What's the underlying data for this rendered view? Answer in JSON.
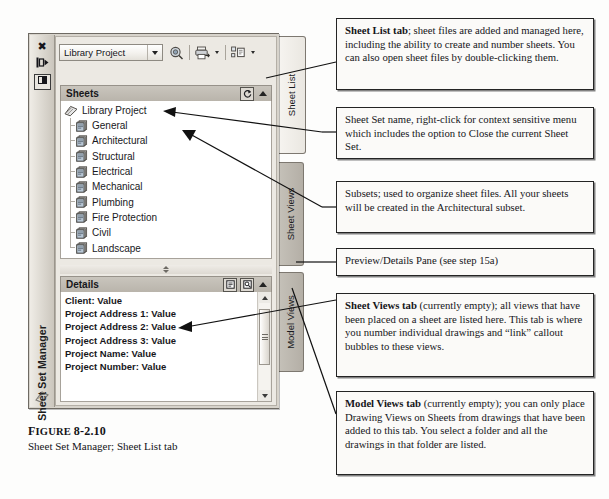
{
  "figure": {
    "label_prefix": "F",
    "label_rest": "IGURE",
    "number": "8-2.10",
    "caption": "Sheet Set Manager; Sheet List tab"
  },
  "palette": {
    "title": "Sheet Set Manager",
    "title_buttons": [
      {
        "name": "close",
        "glyph": "✖"
      },
      {
        "name": "auto-hide",
        "glyph": "❙▶"
      },
      {
        "name": "properties-menu",
        "glyph": "▤"
      }
    ],
    "toolbar": {
      "combo_value": "Library Project",
      "icons": [
        {
          "name": "details-search-icon",
          "has_dropdown": false
        },
        {
          "name": "publish-icon",
          "has_dropdown": true
        },
        {
          "name": "sheet-set-icon",
          "has_dropdown": true
        }
      ]
    },
    "sheets_panel": {
      "title": "Sheets",
      "refresh_label": "⟳",
      "root": "Library Project",
      "items": [
        "General",
        "Architectural",
        "Structural",
        "Electrical",
        "Mechanical",
        "Plumbing",
        "Fire Protection",
        "Civil",
        "Landscape"
      ]
    },
    "details_panel": {
      "title": "Details",
      "lines": [
        "Client: Value",
        "Project Address 1: Value",
        "Project Address 2: Value",
        "Project Address 3: Value",
        "Project Name: Value",
        "Project Number: Value"
      ]
    },
    "tabs": [
      {
        "label": "Sheet List",
        "active": true
      },
      {
        "label": "Sheet Views",
        "active": false
      },
      {
        "label": "Model Views",
        "active": false
      }
    ]
  },
  "callouts": [
    {
      "id": "sheet-list-tab",
      "bold": "Sheet List tab",
      "text": "; sheet files are added and managed here, including the ability to create and number sheets. You can also open sheet files by double-clicking them."
    },
    {
      "id": "sheet-set-name",
      "bold": "",
      "text": "Sheet Set name, right-click for context sensitive menu which includes the option to Close the current Sheet Set."
    },
    {
      "id": "subsets",
      "bold": "",
      "text": "Subsets; used to organize sheet files. All your sheets will be created in the Architectural subset."
    },
    {
      "id": "preview-details-pane",
      "bold": "",
      "text": "Preview/Details Pane (see step 15a)"
    },
    {
      "id": "sheet-views-tab",
      "bold": "Sheet Views tab",
      "text": " (currently empty); all views that have been placed on a sheet are listed here. This tab is where you number individual drawings and “link” callout bubbles to these views."
    },
    {
      "id": "model-views-tab",
      "bold": "Model Views tab",
      "text": " (currently empty); you can only place Drawing Views on Sheets from drawings that have been added to this tab. You select a folder and all the drawings in that folder are listed."
    }
  ]
}
